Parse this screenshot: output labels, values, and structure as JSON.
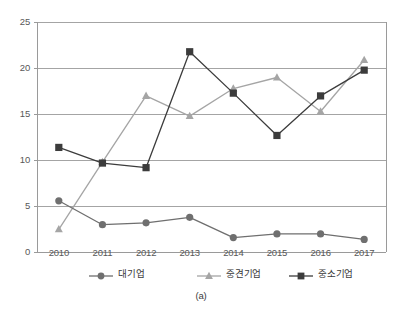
{
  "caption": "(a)",
  "chart_data": {
    "type": "line",
    "title": "",
    "xlabel": "",
    "ylabel": "",
    "categories": [
      "2010",
      "2011",
      "2012",
      "2013",
      "2014",
      "2015",
      "2016",
      "2017"
    ],
    "x": [
      2010,
      2011,
      2012,
      2013,
      2014,
      2015,
      2016,
      2017
    ],
    "ylim": [
      0,
      25
    ],
    "yticks": [
      0,
      5,
      10,
      15,
      20,
      25
    ],
    "ytick_labels": [
      "0",
      "5",
      "10",
      "15",
      "20",
      "25"
    ],
    "grid": "horizontal",
    "legend_position": "bottom",
    "series": [
      {
        "name": "대기업",
        "marker": "circle",
        "color": "#6f6f6f",
        "values": [
          5.6,
          3.0,
          3.2,
          3.8,
          1.6,
          2.0,
          2.0,
          1.4
        ]
      },
      {
        "name": "중견기업",
        "marker": "triangle",
        "color": "#a5a5a5",
        "values": [
          2.5,
          9.8,
          17.0,
          14.8,
          17.8,
          19.0,
          15.3,
          20.9
        ]
      },
      {
        "name": "중소기업",
        "marker": "square",
        "color": "#3c3c3c",
        "values": [
          11.4,
          9.7,
          9.2,
          21.8,
          17.3,
          12.7,
          17.0,
          19.8
        ]
      }
    ]
  },
  "legend": {
    "items": [
      {
        "label": "대기업",
        "marker": "circle-marker-icon"
      },
      {
        "label": "중견기업",
        "marker": "triangle-marker-icon"
      },
      {
        "label": "중소기업",
        "marker": "square-marker-icon"
      }
    ]
  },
  "colors": {
    "grid": "#9a9a9a",
    "axis": "#9a9a9a",
    "tick_text": "#585858",
    "background": "#ffffff"
  }
}
